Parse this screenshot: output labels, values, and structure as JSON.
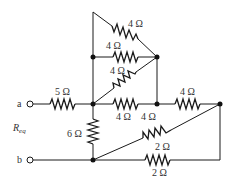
{
  "diagram": {
    "type": "circuit",
    "title": "",
    "terminals": [
      {
        "id": "a",
        "label": "a"
      },
      {
        "id": "b",
        "label": "b"
      }
    ],
    "equivalent_label": {
      "main": "R",
      "sub": "eq"
    },
    "resistors": [
      {
        "id": "r_top_diag",
        "label": "4 Ω",
        "value_ohm": 4
      },
      {
        "id": "r_mid_horiz",
        "label": "4 Ω",
        "value_ohm": 4
      },
      {
        "id": "r_lower_diag",
        "label": "4 Ω",
        "value_ohm": 4
      },
      {
        "id": "r_5",
        "label": "5 Ω",
        "value_ohm": 5
      },
      {
        "id": "r_center_horiz",
        "label": "4 Ω",
        "value_ohm": 4
      },
      {
        "id": "r_right_wire_label",
        "label": "4 Ω",
        "value_ohm": 4
      },
      {
        "id": "r_top_right",
        "label": "4 Ω",
        "value_ohm": 4
      },
      {
        "id": "r_6",
        "label": "6 Ω",
        "value_ohm": 6
      },
      {
        "id": "r_diag_2",
        "label": "2 Ω",
        "value_ohm": 2
      },
      {
        "id": "r_bottom_2",
        "label": "2 Ω",
        "value_ohm": 2
      }
    ],
    "colors": {
      "line": "#1a1a1a",
      "text": "#333333",
      "background": "#ffffff"
    }
  }
}
